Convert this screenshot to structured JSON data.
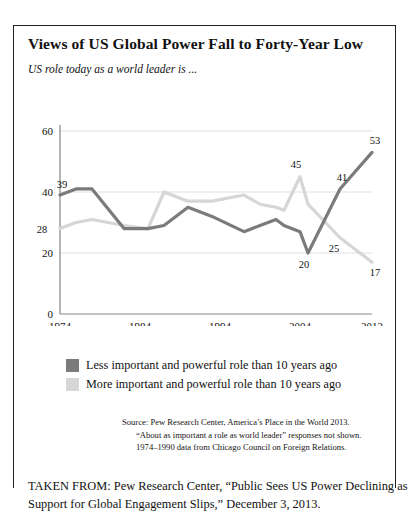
{
  "figure": {
    "title": "Views of US Global Power Fall to Forty-Year Low",
    "subtitle": "US role today as a world leader is ...",
    "caption": "TAKEN FROM: Pew Research Center, “Public Sees US Power Declining as Support for Global Engagement Slips,” December 3, 2013.",
    "source_lines": [
      "Source: Pew Research Center, America’s Place in the World 2013.",
      "“About as important a role as world leader” responses not shown.",
      "1974–1990 data from Chicago Council on Foreign Relations."
    ]
  },
  "legend": {
    "items": [
      {
        "label": "Less important and powerful role than 10 years ago",
        "color": "#7b7b7b",
        "swatch_name": "legend-swatch-less-important"
      },
      {
        "label": "More important and powerful role than 10 years ago",
        "color": "#d6d6d6",
        "swatch_name": "legend-swatch-more-important"
      }
    ]
  },
  "chart_data": {
    "type": "line",
    "title": "Views of US Global Power Fall to Forty-Year Low",
    "subtitle": "US role today as a world leader is ...",
    "xlabel": "",
    "ylabel": "",
    "grid": true,
    "legend_position": "bottom-left",
    "ylim": [
      0,
      60
    ],
    "yticks": [
      0,
      20,
      40,
      60
    ],
    "ytick_labels": [
      "0",
      "20",
      "40",
      "60"
    ],
    "xlim": [
      1974,
      2013
    ],
    "xticks": [
      1974,
      1984,
      1994,
      2004,
      2013
    ],
    "xtick_labels": [
      "1974",
      "1984",
      "1994",
      "2004",
      "2013"
    ],
    "x": [
      1974,
      1976,
      1978,
      1982,
      1985,
      1987,
      1990,
      1993,
      1997,
      1999,
      2001,
      2002,
      2004,
      2005,
      2009,
      2013
    ],
    "series": [
      {
        "name": "Less important and powerful role than 10 years ago",
        "color": "#7b7b7b",
        "values": [
          39,
          41,
          41,
          28,
          28,
          29,
          35,
          32,
          27,
          29,
          31,
          29,
          27,
          20,
          41,
          53
        ]
      },
      {
        "name": "More important and powerful role than 10 years ago",
        "color": "#d6d6d6",
        "values": [
          28,
          30,
          31,
          29,
          28,
          40,
          37,
          37,
          39,
          36,
          35,
          34,
          45,
          36,
          25,
          17
        ]
      }
    ],
    "point_labels": [
      {
        "series": 0,
        "index": 0,
        "text": "39",
        "dx": 2,
        "dy": -7
      },
      {
        "series": 0,
        "index": 13,
        "text": "20",
        "dx": -4,
        "dy": 15
      },
      {
        "series": 0,
        "index": 14,
        "text": "41",
        "dx": 2,
        "dy": -8
      },
      {
        "series": 0,
        "index": 15,
        "text": "53",
        "dx": 3,
        "dy": -8
      },
      {
        "series": 1,
        "index": 0,
        "text": "28",
        "dx": -18,
        "dy": 4
      },
      {
        "series": 1,
        "index": 12,
        "text": "45",
        "dx": -4,
        "dy": -9
      },
      {
        "series": 1,
        "index": 14,
        "text": "25",
        "dx": -6,
        "dy": 14
      },
      {
        "series": 1,
        "index": 15,
        "text": "17",
        "dx": 3,
        "dy": 14
      }
    ]
  }
}
